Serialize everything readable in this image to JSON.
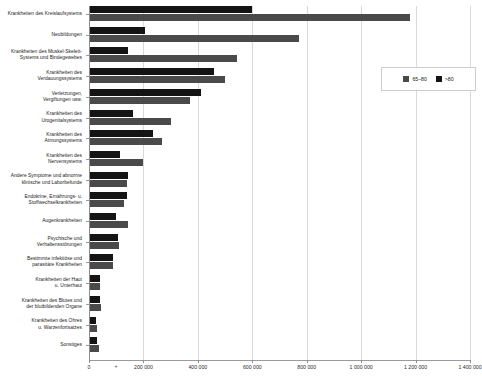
{
  "chart_data": {
    "type": "bar",
    "orientation": "horizontal",
    "title": "",
    "subtitle": "",
    "xlabel": "",
    "ylabel": "",
    "xlim": [
      0,
      1400000
    ],
    "grid": true,
    "legend_position": "top-right",
    "xticks": [
      0,
      200000,
      400000,
      600000,
      800000,
      1000000,
      1200000,
      1400000
    ],
    "xtick_labels": [
      "0",
      "200 000",
      "400 000",
      "600 000",
      "800 000",
      "1 000 000",
      "1 200 000",
      "1 400 000"
    ],
    "minor_tick_marker": "+",
    "categories": [
      "Krankheiten des Kreislaufsystems",
      "Neubildungen",
      "Krankheiten des Muskel-Skelett-Systems und Bindegewebes",
      "Krankheiten des Verdauungssystems",
      "Verletzungen, Vergiftungen usw.",
      "Krankheiten des Urogenitalsystems",
      "Krankheiten des Atmungssystems",
      "Krankheiten des Nervensystems",
      "Andere Symptome und abnorme klinische und Laborbefunde",
      "Endokrine, Ernährungs- u. Stoffwechselkrankheiten",
      "Augenkrankheiten",
      "Psychische und Verhaltensstörungen",
      "Bestimmte infektiöse und parasitäre Krankheiten",
      "Krankheiten der Haut u. Unterhaut",
      "Krankheiten des Blutes und der blutbildenden Organe",
      "Krankheiten des Ohres u. Warzenfortsatzes",
      "Sonstiges"
    ],
    "category_lines": [
      [
        "Krankheiten des Kreislaufsystems"
      ],
      [
        "Neubildungen"
      ],
      [
        "Krankheiten des Muskel-Skelett-",
        "Systems und Bindegewebes"
      ],
      [
        "Krankheiten des",
        "Verdauungssystems"
      ],
      [
        "Verletzungen,",
        "Vergiftungen usw."
      ],
      [
        "Krankheiten des",
        "Urogenitalsystems"
      ],
      [
        "Krankheiten des",
        "Atmungssystems"
      ],
      [
        "Krankheiten des",
        "Nervensystems"
      ],
      [
        "Andere Symptome und abnorme",
        "klinische und Laborbefunde"
      ],
      [
        "Endokrine, Ernährungs- u.",
        "Stoffwechselkrankheiten"
      ],
      [
        "Augenkrankheiten"
      ],
      [
        "Psychische und",
        "Verhaltensstörungen"
      ],
      [
        "Bestimmte infektiöse und",
        "parasitäre Krankheiten"
      ],
      [
        "Krankheiten der Haut",
        "u. Unterhaut"
      ],
      [
        "Krankheiten des Blutes und",
        "der blutbildenden Organe"
      ],
      [
        "Krankheiten des Ohres",
        "u. Warzenfortsatzes"
      ],
      [
        "Sonstiges"
      ]
    ],
    "series": [
      {
        "name": "65–80",
        "color": "#4a4a4a",
        "values": [
          1180000,
          770000,
          545000,
          500000,
          370000,
          300000,
          270000,
          200000,
          140000,
          130000,
          145000,
          110000,
          90000,
          42000,
          45000,
          28000,
          38000
        ]
      },
      {
        "name": ">80",
        "color": "#141414",
        "values": [
          600000,
          205000,
          145000,
          460000,
          410000,
          160000,
          235000,
          115000,
          145000,
          140000,
          100000,
          105000,
          90000,
          40000,
          40000,
          25000,
          30000
        ]
      }
    ]
  },
  "legend": {
    "items": [
      {
        "label": "65–80",
        "color": "#4a4a4a"
      },
      {
        "label": ">80",
        "color": "#141414"
      }
    ]
  }
}
